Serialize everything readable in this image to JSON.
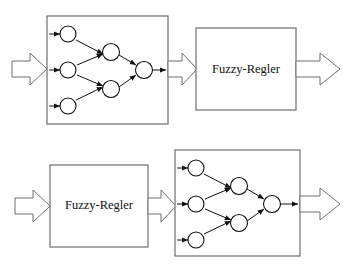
{
  "diagram": {
    "background_color": "#ffffff",
    "stroke_color": "#3a3a3a",
    "line_color": "#111111",
    "text_color": "#111111",
    "rows": [
      {
        "id": "row-top",
        "order": "neural-network-then-fuzzy",
        "blocks": [
          {
            "id": "nn-top",
            "type": "neural-network",
            "label": "",
            "x": 47,
            "y": 16,
            "w": 121,
            "h": 108
          },
          {
            "id": "fuzzy-top",
            "type": "labelled-box",
            "label": "Fuzzy-Regler",
            "x": 196,
            "y": 28,
            "w": 100,
            "h": 82
          }
        ],
        "arrows": [
          {
            "id": "arrow-top-in",
            "x": 12,
            "y": 69,
            "w": 36,
            "h": 30
          },
          {
            "id": "arrow-top-mid",
            "x": 168,
            "y": 69,
            "w": 30,
            "h": 30
          },
          {
            "id": "arrow-top-out",
            "x": 300,
            "y": 69,
            "w": 40,
            "h": 30
          }
        ]
      },
      {
        "id": "row-bottom",
        "order": "fuzzy-then-neural-network",
        "blocks": [
          {
            "id": "fuzzy-bottom",
            "type": "labelled-box",
            "label": "Fuzzy-Regler",
            "x": 50,
            "y": 165,
            "w": 98,
            "h": 82
          },
          {
            "id": "nn-bottom",
            "type": "neural-network",
            "label": "",
            "x": 175,
            "y": 150,
            "w": 125,
            "h": 106
          }
        ],
        "arrows": [
          {
            "id": "arrow-bottom-in",
            "x": 15,
            "y": 205,
            "w": 35,
            "h": 30
          },
          {
            "id": "arrow-bottom-mid",
            "x": 148,
            "y": 205,
            "w": 28,
            "h": 30
          },
          {
            "id": "arrow-bottom-out",
            "x": 300,
            "y": 203,
            "w": 40,
            "h": 30
          }
        ]
      }
    ],
    "network": {
      "layers": [
        {
          "name": "input",
          "node_count": 3
        },
        {
          "name": "hidden",
          "node_count": 2
        },
        {
          "name": "output",
          "node_count": 1
        }
      ],
      "node_radius": 8,
      "edges": [
        "input-1 -> hidden-1",
        "input-2 -> hidden-1",
        "input-2 -> hidden-2",
        "input-3 -> hidden-2",
        "hidden-1 -> output-1",
        "hidden-2 -> output-1"
      ],
      "input_stub_arrows": 3,
      "output_stub_arrows": 1
    },
    "labels": {
      "fuzzy_regler": "Fuzzy-Regler"
    }
  }
}
